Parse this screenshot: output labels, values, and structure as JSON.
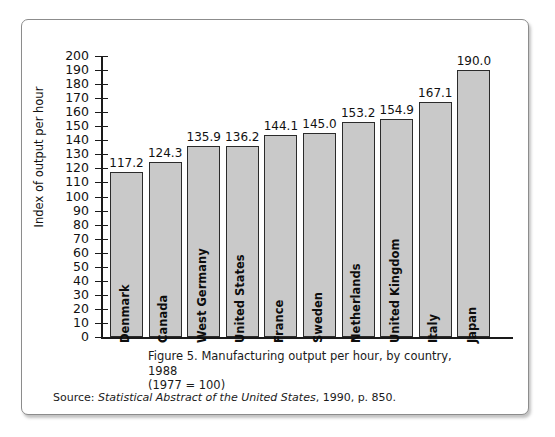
{
  "figure": {
    "caption_line1": "Figure 5.  Manufacturing output per hour, by country, 1988",
    "caption_line2": "(1977 = 100)",
    "source_prefix": "Source:",
    "source_title": "Statistical Abstract of the United States",
    "source_rest": ", 1990, p. 850."
  },
  "chart_data": {
    "type": "bar",
    "title": "Figure 5.  Manufacturing output per hour, by country, 1988 (1977 = 100)",
    "xlabel": "",
    "ylabel": "Index of output per hour",
    "ylim": [
      0,
      200
    ],
    "ytick_step": 10,
    "grid": false,
    "legend": "none",
    "categories": [
      "Denmark",
      "Canada",
      "West Germany",
      "United States",
      "France",
      "Sweden",
      "Netherlands",
      "United Kingdom",
      "Italy",
      "Japan"
    ],
    "values": [
      117.2,
      124.3,
      135.9,
      136.2,
      144.1,
      145.0,
      153.2,
      154.9,
      167.1,
      190.0
    ],
    "value_labels": [
      "117.2",
      "124.3",
      "135.9",
      "136.2",
      "144.1",
      "145.0",
      "153.2",
      "154.9",
      "167.1",
      "190.0"
    ],
    "ytick_labels": [
      "200",
      "190",
      "180",
      "170",
      "160",
      "150",
      "140",
      "130",
      "120",
      "110",
      "100",
      "90",
      "80",
      "70",
      "60",
      "50",
      "40",
      "30",
      "20",
      "10",
      "0"
    ],
    "bar_fill_color": "#c9c9c9",
    "bar_edge_color": "#2b2b2b"
  }
}
